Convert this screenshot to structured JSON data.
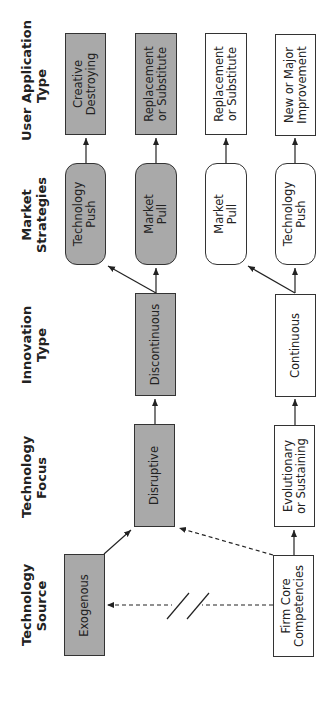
{
  "row_headers": {
    "user_application_type": "User Application\nType",
    "market_strategies": "Market\nStrategies",
    "innovation_type": "Innovation\nType",
    "technology_focus": "Technology\nFocus",
    "technology_source": "Technology\nSource"
  },
  "nodes": {
    "creative_destroying": "Creative\nDestroying",
    "replacement_gray": "Replacement\nor Substitute",
    "replacement_white": "Replacement\nor Substitute",
    "new_or_major": "New or Major\nImprovement",
    "tech_push_gray": "Technology\nPush",
    "market_pull_gray": "Market\nPull",
    "market_pull_white": "Market\nPull",
    "tech_push_white": "Technology\nPush",
    "discontinuous": "Discontinuous",
    "continuous": "Continuous",
    "disruptive": "Disruptive",
    "evolutionary": "Evolutionary\nor Sustaining",
    "exogenous": "Exogenous",
    "firm_core": "Firm Core\nCompetencies"
  },
  "colors": {
    "highlight_fill": "#a9a9a9",
    "plain_fill": "#ffffff",
    "stroke": "#333333"
  }
}
